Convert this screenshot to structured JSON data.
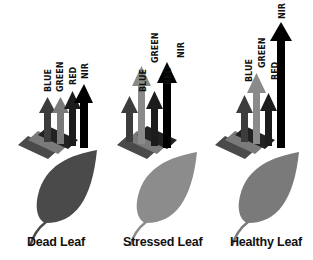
{
  "diagram": {
    "type": "reflectance-comparison",
    "colors": {
      "blue_arrow": "#3c3c3c",
      "green_arrow": "#8a8a8a",
      "red_arrow": "#1c1c1c",
      "nir_arrow": "#000000",
      "dead_leaf": "#4a4a4a",
      "stressed_leaf": "#8c8c8c",
      "healthy_leaf": "#7a7a7a",
      "incoming_blue": "#4a4a4a",
      "incoming_green": "#7a7a7a"
    },
    "panels": [
      {
        "caption": "Dead Leaf",
        "bands": [
          {
            "label": "BLUE",
            "relative_height": 0.55
          },
          {
            "label": "GREEN",
            "relative_height": 0.55
          },
          {
            "label": "RED",
            "relative_height": 0.6
          },
          {
            "label": "NIR",
            "relative_height": 0.65
          }
        ]
      },
      {
        "caption": "Stressed Leaf",
        "bands": [
          {
            "label": "BLUE",
            "relative_height": 0.45
          },
          {
            "label": "GREEN",
            "relative_height": 0.75
          },
          {
            "label": "RED",
            "relative_height": 0.5
          },
          {
            "label": "NIR",
            "relative_height": 0.8
          }
        ]
      },
      {
        "caption": "Healthy Leaf",
        "bands": [
          {
            "label": "BLUE",
            "relative_height": 0.45
          },
          {
            "label": "GREEN",
            "relative_height": 0.65
          },
          {
            "label": "RED",
            "relative_height": 0.5
          },
          {
            "label": "NIR",
            "relative_height": 1.0
          }
        ]
      }
    ]
  }
}
